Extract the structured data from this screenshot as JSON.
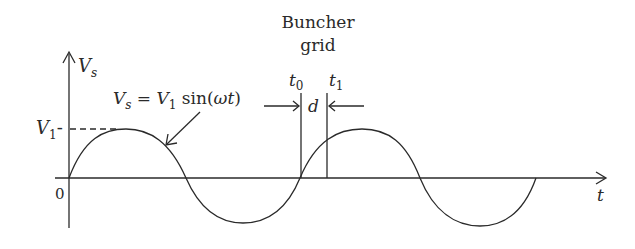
{
  "title": {
    "line1": "Buncher",
    "line2": "grid"
  },
  "axes": {
    "y_label": "V",
    "y_label_sub": "s",
    "x_label": "t",
    "origin_label": "0",
    "amplitude_label": "V",
    "amplitude_sub": "1",
    "amplitude_tick": "-"
  },
  "equation": {
    "lhs": "V",
    "lhs_sub": "s",
    "eq": " = ",
    "rhs_v": "V",
    "rhs_sub": "1",
    "rhs_func": " sin(",
    "rhs_arg": "ωt",
    "rhs_close": ")"
  },
  "grid_marks": {
    "t0": "t",
    "t0_sub": "0",
    "t1": "t",
    "t1_sub": "1",
    "gap": "d"
  },
  "colors": {
    "stroke": "#2a2a2a",
    "background": "#ffffff"
  }
}
